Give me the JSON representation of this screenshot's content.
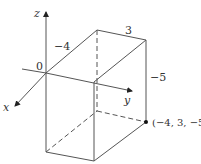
{
  "diagram": {
    "type": "3d-coordinate-box",
    "axes": {
      "x_label": "x",
      "y_label": "y",
      "z_label": "z",
      "origin_label": "0"
    },
    "dimensions": {
      "x_label": "−4",
      "y_label": "3",
      "z_label": "−5"
    },
    "point": {
      "label": "(−4, 3, −5)",
      "coords": [
        -4,
        3,
        -5
      ]
    },
    "colors": {
      "line": "#555555",
      "text": "#333333",
      "background": "#ffffff"
    }
  }
}
